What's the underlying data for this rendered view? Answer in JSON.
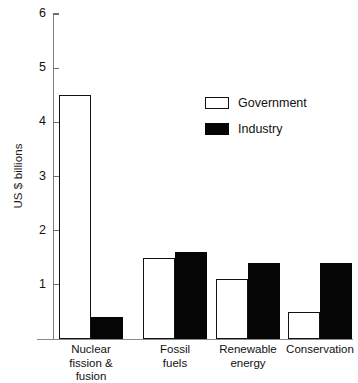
{
  "chart_data": {
    "type": "bar",
    "title": "",
    "xlabel": "",
    "ylabel": "US $ billions",
    "ylim": [
      0,
      6
    ],
    "yticks": [
      1,
      2,
      3,
      4,
      5,
      6
    ],
    "ytick_labels": [
      "1",
      "2",
      "3",
      "4",
      "5",
      "6"
    ],
    "grid": false,
    "legend_position": "upper-right",
    "categories": [
      "Nuclear\nfission &\nfusion",
      "Fossil\nfuels",
      "Renewable\nenergy",
      "Conservation"
    ],
    "category_labels": [
      {
        "line1": "Nuclear",
        "line2": "fission &",
        "line3": "fusion"
      },
      {
        "line1": "Fossil",
        "line2": "fuels",
        "line3": ""
      },
      {
        "line1": "Renewable",
        "line2": "energy",
        "line3": ""
      },
      {
        "line1": "Conservation",
        "line2": "",
        "line3": ""
      }
    ],
    "series": [
      {
        "name": "Government",
        "color": "#ffffff",
        "edge_color": "#111111",
        "values": [
          4.5,
          1.5,
          1.1,
          0.5
        ]
      },
      {
        "name": "Industry",
        "color": "#050505",
        "edge_color": "#050505",
        "values": [
          0.4,
          1.6,
          1.4,
          1.4
        ]
      }
    ]
  },
  "legend": {
    "items": [
      {
        "label": "Government",
        "swatch": "open-square-swatch"
      },
      {
        "label": "Industry",
        "swatch": "filled-square-swatch"
      }
    ]
  }
}
